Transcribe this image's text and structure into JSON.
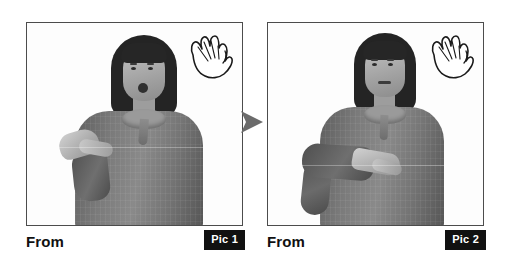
{
  "canvas": {
    "width": 505,
    "height": 271,
    "background": "#ffffff"
  },
  "figure": {
    "type": "sign-language-sequence",
    "transition_arrow": "right-triangle-arrow",
    "arrow_color": "#6b6b6b"
  },
  "panels": [
    {
      "id": "panel-1",
      "caption_label": "From",
      "badge_label": "Pic 1",
      "badge_background": "#111111",
      "badge_text_color": "#ffffff",
      "border_color": "#4c4c4c",
      "photo": {
        "alt": "Grayscale photo of a woman in a gray collared shirt, mouth open, right hand raised at chest level with palm angled upward",
        "subject": "woman signing",
        "background": "white",
        "shirt_color": "#7a7a7a",
        "hair_color": "#242424"
      },
      "hand_icon": "open-hand-icon"
    },
    {
      "id": "panel-2",
      "caption_label": "From",
      "badge_label": "Pic 2",
      "badge_background": "#111111",
      "badge_text_color": "#ffffff",
      "border_color": "#4c4c4c",
      "photo": {
        "alt": "Grayscale photo of the same woman, mouth closed, forearm held horizontally across the torso with hand flat and palm down",
        "subject": "woman signing",
        "background": "white",
        "shirt_color": "#7a7a7a",
        "hair_color": "#242424"
      },
      "hand_icon": "open-hand-icon"
    }
  ]
}
